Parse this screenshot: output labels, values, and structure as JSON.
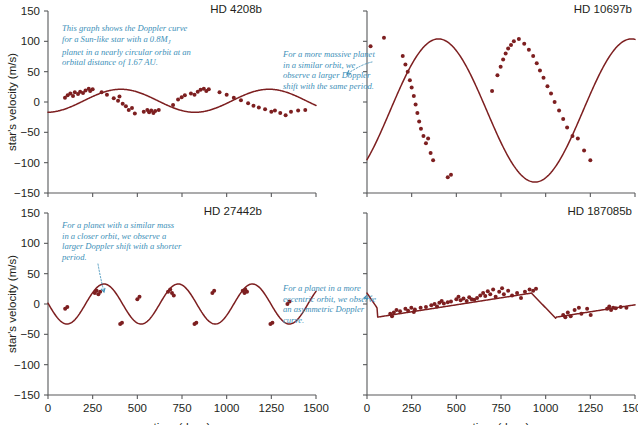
{
  "figure": {
    "axis_titles": {
      "y": "star's velocity (m/s)",
      "x": "time (days)"
    },
    "y_ticks": [
      "150",
      "100",
      "50",
      "0",
      "-50",
      "-100",
      "-150"
    ],
    "x_ticks": [
      "0",
      "250",
      "500",
      "750",
      "1000",
      "1250",
      "1500"
    ],
    "colors": {
      "curve": "#7d1f20",
      "points": "#7d1f20",
      "annotation": "#3d8fb8",
      "axis": "#58595b",
      "background": "#ffffff"
    }
  },
  "chart_data": [
    {
      "type": "scatter",
      "panel": "top-left",
      "title": "HD 4208b",
      "xlabel": "time (days)",
      "ylabel": "star's velocity (m/s)",
      "xlim": [
        0,
        1500
      ],
      "ylim": [
        -150,
        150
      ],
      "xticks": [
        0,
        250,
        500,
        750,
        1000,
        1250,
        1500
      ],
      "yticks": [
        -150,
        -100,
        -50,
        0,
        50,
        100,
        150
      ],
      "grid": false,
      "legend": "none",
      "fit": {
        "model": "circular",
        "amplitude": 19,
        "period": 830,
        "phase": 200,
        "offset": 2
      },
      "annotation": "This graph shows the Doppler curve for a Sun-like star with a 0.8M_J planet in a nearly circular orbit at an orbital distance of 1.67 AU.",
      "annotation_lines": [
        "This graph shows the Doppler curve",
        "for a Sun-like star with a 0.8M",
        "planet in a nearly circular orbit at an",
        "orbital distance of 1.67 AU."
      ],
      "annotation_subscript": "J",
      "points": [
        [
          95,
          7
        ],
        [
          110,
          11
        ],
        [
          125,
          14
        ],
        [
          140,
          10
        ],
        [
          150,
          16
        ],
        [
          168,
          13
        ],
        [
          180,
          17
        ],
        [
          196,
          15
        ],
        [
          210,
          19
        ],
        [
          228,
          22
        ],
        [
          236,
          18
        ],
        [
          250,
          21
        ],
        [
          300,
          16
        ],
        [
          330,
          12
        ],
        [
          368,
          6
        ],
        [
          392,
          2
        ],
        [
          400,
          9
        ],
        [
          418,
          -3
        ],
        [
          436,
          -7
        ],
        [
          452,
          -13
        ],
        [
          470,
          -10
        ],
        [
          486,
          -19
        ],
        [
          536,
          -16
        ],
        [
          556,
          -13
        ],
        [
          566,
          -17
        ],
        [
          578,
          -14
        ],
        [
          590,
          -18
        ],
        [
          600,
          -15
        ],
        [
          620,
          -13
        ],
        [
          700,
          -5
        ],
        [
          728,
          4
        ],
        [
          748,
          8
        ],
        [
          766,
          11
        ],
        [
          800,
          14
        ],
        [
          820,
          12
        ],
        [
          838,
          17
        ],
        [
          854,
          20
        ],
        [
          872,
          22
        ],
        [
          886,
          18
        ],
        [
          900,
          21
        ],
        [
          960,
          16
        ],
        [
          1000,
          12
        ],
        [
          1040,
          7
        ],
        [
          1080,
          3
        ],
        [
          1120,
          -2
        ],
        [
          1150,
          -6
        ],
        [
          1180,
          -9
        ],
        [
          1215,
          -12
        ],
        [
          1250,
          -16
        ],
        [
          1270,
          -14
        ],
        [
          1300,
          -18
        ],
        [
          1330,
          -22
        ],
        [
          1360,
          -16
        ],
        [
          1400,
          -14
        ],
        [
          1440,
          -13
        ]
      ]
    },
    {
      "type": "scatter",
      "panel": "top-right",
      "title": "HD 10697b",
      "xlabel": "time (days)",
      "ylabel": "star's velocity (m/s)",
      "xlim": [
        0,
        1500
      ],
      "ylim": [
        -150,
        150
      ],
      "xticks": [
        0,
        250,
        500,
        750,
        1000,
        1250,
        1500
      ],
      "yticks": [
        -150,
        -100,
        -50,
        0,
        50,
        100,
        150
      ],
      "grid": false,
      "legend": "none",
      "fit": {
        "model": "circular",
        "amplitude": 118,
        "period": 1080,
        "phase": 130,
        "offset": -14
      },
      "annotation": "For a more massive planet in a similar orbit, we observe a larger Doppler shift with the same period.",
      "annotation_lines": [
        "For a more massive planet",
        "in a similar orbit, we",
        "observe a larger Doppler",
        "shift with the same period."
      ],
      "points": [
        [
          20,
          92
        ],
        [
          95,
          106
        ],
        [
          200,
          76
        ],
        [
          215,
          62
        ],
        [
          228,
          50
        ],
        [
          240,
          36
        ],
        [
          250,
          24
        ],
        [
          262,
          10
        ],
        [
          272,
          -4
        ],
        [
          282,
          -18
        ],
        [
          292,
          -32
        ],
        [
          302,
          -44
        ],
        [
          316,
          -56
        ],
        [
          330,
          -68
        ],
        [
          342,
          -60
        ],
        [
          356,
          -84
        ],
        [
          370,
          -96
        ],
        [
          452,
          -124
        ],
        [
          470,
          -120
        ],
        [
          700,
          18
        ],
        [
          730,
          44
        ],
        [
          748,
          58
        ],
        [
          762,
          70
        ],
        [
          776,
          80
        ],
        [
          790,
          88
        ],
        [
          806,
          94
        ],
        [
          822,
          100
        ],
        [
          850,
          104
        ],
        [
          880,
          96
        ],
        [
          906,
          86
        ],
        [
          930,
          76
        ],
        [
          950,
          64
        ],
        [
          968,
          52
        ],
        [
          988,
          40
        ],
        [
          1010,
          26
        ],
        [
          1030,
          14
        ],
        [
          1050,
          0
        ],
        [
          1075,
          -14
        ],
        [
          1098,
          -28
        ],
        [
          1120,
          -42
        ],
        [
          1150,
          -56
        ],
        [
          1180,
          -60
        ],
        [
          1215,
          -80
        ],
        [
          1250,
          -96
        ]
      ]
    },
    {
      "type": "scatter",
      "panel": "bottom-left",
      "title": "HD 27442b",
      "xlabel": "time (days)",
      "ylabel": "star's velocity (m/s)",
      "xlim": [
        0,
        1500
      ],
      "ylim": [
        -150,
        150
      ],
      "xticks": [
        0,
        250,
        500,
        750,
        1000,
        1250,
        1500
      ],
      "yticks": [
        -150,
        -100,
        -50,
        0,
        50,
        100,
        150
      ],
      "grid": false,
      "legend": "none",
      "fit": {
        "model": "circular",
        "amplitude": 33,
        "period": 415,
        "phase": 210,
        "offset": 0
      },
      "annotation": "For a planet with a similar mass in a closer orbit, we observe a larger Doppler shift with a shorter period.",
      "annotation_lines": [
        "For a planet with a similar mass",
        "in a closer orbit, we observe a",
        "larger Doppler shift with a shorter",
        "period."
      ],
      "points": [
        [
          96,
          -8
        ],
        [
          108,
          -5
        ],
        [
          262,
          18
        ],
        [
          272,
          22
        ],
        [
          282,
          16
        ],
        [
          292,
          20
        ],
        [
          404,
          -33
        ],
        [
          414,
          -31
        ],
        [
          500,
          8
        ],
        [
          512,
          12
        ],
        [
          672,
          20
        ],
        [
          684,
          24
        ],
        [
          694,
          18
        ],
        [
          704,
          14
        ],
        [
          820,
          -33
        ],
        [
          830,
          -31
        ],
        [
          920,
          18
        ],
        [
          930,
          22
        ],
        [
          1090,
          22
        ],
        [
          1100,
          18
        ],
        [
          1104,
          24
        ],
        [
          1114,
          20
        ],
        [
          1245,
          -33
        ],
        [
          1256,
          -31
        ],
        [
          1340,
          0
        ],
        [
          1352,
          4
        ]
      ]
    },
    {
      "type": "scatter",
      "panel": "bottom-right",
      "title": "HD 187085b",
      "xlabel": "time (days)",
      "ylabel": "star's velocity (m/s)",
      "xlim": [
        0,
        1500
      ],
      "ylim": [
        -150,
        150
      ],
      "xticks": [
        0,
        250,
        500,
        750,
        1000,
        1250,
        1500
      ],
      "yticks": [
        -150,
        -100,
        -50,
        0,
        50,
        100,
        150
      ],
      "grid": false,
      "legend": "none",
      "fit": {
        "model": "eccentric",
        "amplitude": 30,
        "period": 1000,
        "eccentricity": 0.75
      },
      "annotation": "For a planet in a more eccentric orbit, we observe an asymmetric Doppler curve.",
      "annotation_lines": [
        "For a planet in a more",
        "eccentric orbit, we observe",
        "an asymmetric Doppler",
        "curve."
      ],
      "points": [
        [
          130,
          -16
        ],
        [
          140,
          -20
        ],
        [
          150,
          -14
        ],
        [
          165,
          -10
        ],
        [
          185,
          -12
        ],
        [
          215,
          -8
        ],
        [
          230,
          -11
        ],
        [
          248,
          -6
        ],
        [
          262,
          -13
        ],
        [
          268,
          -9
        ],
        [
          300,
          -6
        ],
        [
          330,
          -5
        ],
        [
          360,
          -2
        ],
        [
          378,
          0
        ],
        [
          392,
          -4
        ],
        [
          405,
          2
        ],
        [
          418,
          5
        ],
        [
          430,
          1
        ],
        [
          452,
          3
        ],
        [
          470,
          4
        ],
        [
          500,
          8
        ],
        [
          512,
          12
        ],
        [
          524,
          6
        ],
        [
          540,
          9
        ],
        [
          558,
          5
        ],
        [
          572,
          11
        ],
        [
          586,
          8
        ],
        [
          600,
          7
        ],
        [
          616,
          10
        ],
        [
          634,
          14
        ],
        [
          650,
          18
        ],
        [
          662,
          13
        ],
        [
          676,
          21
        ],
        [
          690,
          16
        ],
        [
          706,
          24
        ],
        [
          720,
          12
        ],
        [
          740,
          20
        ],
        [
          756,
          26
        ],
        [
          766,
          16
        ],
        [
          790,
          22
        ],
        [
          812,
          14
        ],
        [
          840,
          18
        ],
        [
          862,
          10
        ],
        [
          884,
          20
        ],
        [
          910,
          24
        ],
        [
          930,
          22
        ],
        [
          946,
          25
        ],
        [
          1098,
          -18
        ],
        [
          1110,
          -22
        ],
        [
          1124,
          -14
        ],
        [
          1140,
          -20
        ],
        [
          1162,
          -10
        ],
        [
          1186,
          -6
        ],
        [
          1200,
          -16
        ],
        [
          1232,
          -8
        ],
        [
          1252,
          -18
        ],
        [
          1344,
          -8
        ],
        [
          1356,
          -4
        ],
        [
          1366,
          -10
        ],
        [
          1378,
          -6
        ],
        [
          1392,
          -7
        ],
        [
          1420,
          -5
        ],
        [
          1452,
          -6
        ]
      ]
    }
  ]
}
